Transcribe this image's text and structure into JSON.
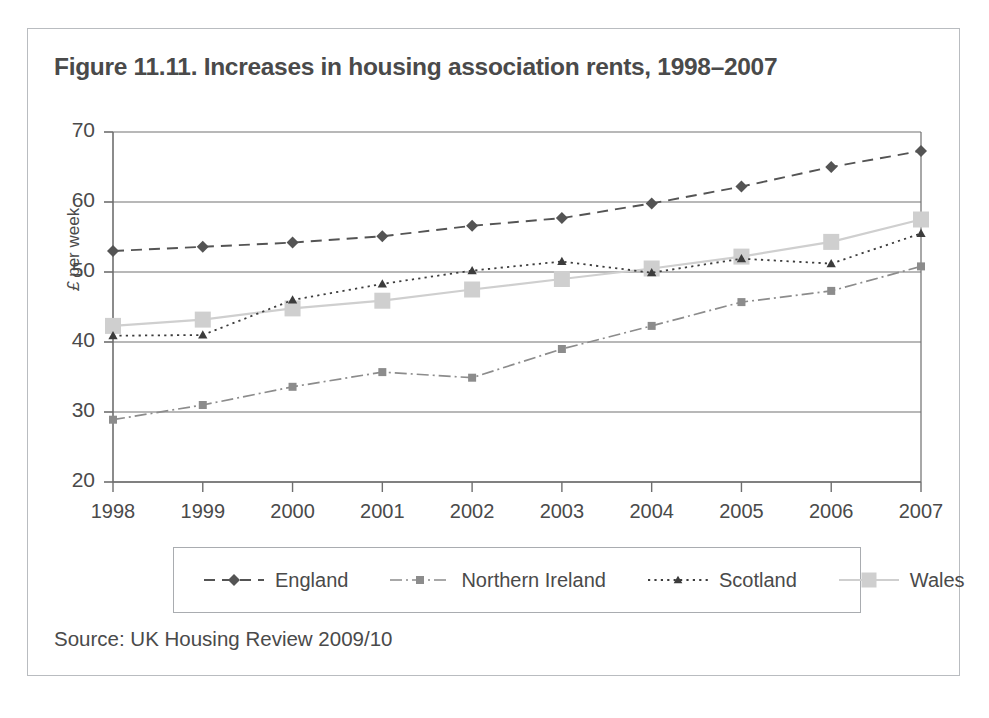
{
  "figure": {
    "title": "Figure 11.11. Increases in housing association rents, 1998–2007",
    "source": "Source: UK Housing Review 2009/10"
  },
  "axis": {
    "ylabel_prefix": "£",
    "ylabel_rest": " per week",
    "yticks": [
      "70",
      "60",
      "50",
      "40",
      "30",
      "20"
    ],
    "xticks": [
      "1998",
      "1999",
      "2000",
      "2001",
      "2002",
      "2003",
      "2004",
      "2005",
      "2006",
      "2007"
    ]
  },
  "legend": {
    "items": [
      {
        "label": "England",
        "marker": "diamond",
        "dash": "dashed",
        "color": "#545454"
      },
      {
        "label": "Northern Ireland",
        "marker": "square",
        "dash": "dash-dot",
        "color": "#8c8c8c"
      },
      {
        "label": "Scotland",
        "marker": "triangle",
        "dash": "dotted",
        "color": "#3c3c3c"
      },
      {
        "label": "Wales",
        "marker": "square",
        "dash": "solid",
        "color": "#cfcfcf"
      }
    ]
  },
  "colors": {
    "card_border": "#b9bcc0",
    "grid": "#737373",
    "axis": "#6e6e6e",
    "text": "#4a4a4a",
    "england": "#545454",
    "northern_ireland": "#8c8c8c",
    "scotland": "#3c3c3c",
    "wales": "#cfcfcf"
  },
  "chart_data": {
    "type": "line",
    "title": "Figure 11.11. Increases in housing association rents, 1998–2007",
    "xlabel": "",
    "ylabel": "£ per week",
    "x": [
      1998,
      1999,
      2000,
      2001,
      2002,
      2003,
      2004,
      2005,
      2006,
      2007
    ],
    "categories": [
      "1998",
      "1999",
      "2000",
      "2001",
      "2002",
      "2003",
      "2004",
      "2005",
      "2006",
      "2007"
    ],
    "ylim": [
      20,
      70
    ],
    "yticks": [
      20,
      30,
      40,
      50,
      60,
      70
    ],
    "grid": true,
    "legend_position": "bottom",
    "series": [
      {
        "name": "England",
        "values": [
          53.0,
          53.6,
          54.2,
          55.1,
          56.6,
          57.7,
          59.8,
          62.2,
          65.0,
          67.3
        ]
      },
      {
        "name": "Northern Ireland",
        "values": [
          28.9,
          31.0,
          33.6,
          35.7,
          34.9,
          39.0,
          42.3,
          45.7,
          47.3,
          50.8
        ]
      },
      {
        "name": "Scotland",
        "values": [
          40.9,
          41.0,
          46.0,
          48.3,
          50.2,
          51.5,
          49.9,
          51.9,
          51.2,
          55.5
        ]
      },
      {
        "name": "Wales",
        "values": [
          42.3,
          43.2,
          44.8,
          45.9,
          47.5,
          49.0,
          50.5,
          52.2,
          54.3,
          57.5
        ]
      }
    ]
  }
}
